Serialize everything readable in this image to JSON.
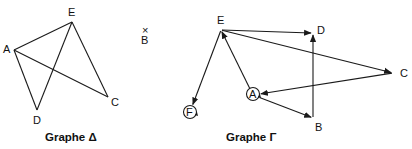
{
  "graphs": [
    {
      "id": "delta",
      "caption": "Graphe Δ",
      "directed": false,
      "vertices": [
        {
          "name": "A",
          "x": 14,
          "y": 50,
          "lx": 3,
          "ly": 53
        },
        {
          "name": "E",
          "x": 72,
          "y": 22,
          "lx": 68,
          "ly": 16
        },
        {
          "name": "C",
          "x": 108,
          "y": 97,
          "lx": 111,
          "ly": 106
        },
        {
          "name": "D",
          "x": 37,
          "y": 110,
          "lx": 33,
          "ly": 124
        },
        {
          "name": "B",
          "x": 145,
          "y": 31,
          "lx": 141,
          "ly": 44,
          "marker": "×"
        }
      ],
      "edges": [
        [
          "A",
          "E"
        ],
        [
          "A",
          "C"
        ],
        [
          "A",
          "D"
        ],
        [
          "D",
          "E"
        ],
        [
          "E",
          "C"
        ]
      ]
    },
    {
      "id": "gamma",
      "caption": "Graphe Γ",
      "directed": true,
      "vertices": [
        {
          "name": "E",
          "x": 221,
          "y": 30,
          "lx": 217,
          "ly": 24
        },
        {
          "name": "D",
          "x": 313,
          "y": 33,
          "lx": 317,
          "ly": 34
        },
        {
          "name": "C",
          "x": 393,
          "y": 73,
          "lx": 400,
          "ly": 77
        },
        {
          "name": "A",
          "x": 253,
          "y": 95,
          "lx": 249,
          "ly": 98,
          "loop": true
        },
        {
          "name": "B",
          "x": 313,
          "y": 118,
          "lx": 315,
          "ly": 131
        },
        {
          "name": "F",
          "x": 190,
          "y": 112,
          "lx": 186,
          "ly": 116,
          "loop": true
        }
      ],
      "edges": [
        [
          "E",
          "D"
        ],
        [
          "E",
          "C"
        ],
        [
          "E",
          "F"
        ],
        [
          "A",
          "E"
        ],
        [
          "A",
          "B"
        ],
        [
          "C",
          "A"
        ],
        [
          "B",
          "D"
        ]
      ]
    }
  ],
  "captions": {
    "delta": {
      "text": "Graphe Δ",
      "x": 45,
      "y": 141
    },
    "gamma": {
      "text": "Graphe Γ",
      "x": 226,
      "y": 141
    }
  }
}
